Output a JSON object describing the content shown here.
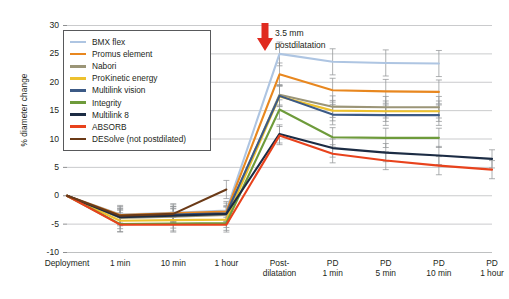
{
  "chart_data": {
    "type": "line",
    "title": "",
    "xlabel": "",
    "ylabel": "% diameter change",
    "ylim": [
      -10,
      30
    ],
    "ytick_values": [
      30,
      25,
      20,
      15,
      10,
      5,
      0,
      -5,
      -10
    ],
    "ytick_labels": [
      "30",
      "25",
      "20",
      "15",
      "10",
      "5",
      "0",
      "-5",
      "-10"
    ],
    "grid": "horizontal",
    "legend_position": "upper-left-inside",
    "categories": [
      "Deployment",
      "1 min",
      "10 min",
      "1 hour",
      "Post-dilatation",
      "PD 1 min",
      "PD 5 min",
      "PD 10 min",
      "PD 1 hour"
    ],
    "category_lines": [
      [
        "Deployment"
      ],
      [
        "1 min"
      ],
      [
        "10 min"
      ],
      [
        "1 hour"
      ],
      [
        "Post-",
        "dilatation"
      ],
      [
        "PD",
        "1 min"
      ],
      [
        "PD",
        "5 min"
      ],
      [
        "PD",
        "10 min"
      ],
      [
        "PD",
        "1 hour"
      ]
    ],
    "annotations": [
      {
        "name": "postdilatation-arrow",
        "text_lines": [
          "3.5 mm",
          "postdilatation"
        ],
        "arrow_color": "#e02b20",
        "at_category": "Post-dilatation"
      }
    ],
    "series": [
      {
        "name": "BMX flex",
        "color": "#aec5e2",
        "values": [
          0,
          -3.3,
          -3.0,
          -2.6,
          25.0,
          23.6,
          23.4,
          23.3,
          null
        ],
        "errors": [
          0,
          1.6,
          1.6,
          1.6,
          2.1,
          2.3,
          2.3,
          2.3,
          null
        ]
      },
      {
        "name": "Promus element",
        "color": "#e8871f",
        "values": [
          0,
          -3.4,
          -3.1,
          -2.8,
          21.4,
          18.6,
          18.4,
          18.3,
          null
        ],
        "errors": [
          0,
          1.5,
          1.5,
          1.5,
          2.0,
          2.1,
          2.1,
          2.1,
          null
        ]
      },
      {
        "name": "Nabori",
        "color": "#9b9577",
        "values": [
          0,
          -3.9,
          -3.7,
          -3.4,
          17.8,
          15.7,
          15.6,
          15.6,
          null
        ],
        "errors": [
          0,
          1.4,
          1.4,
          1.4,
          1.8,
          1.9,
          1.9,
          1.9,
          null
        ]
      },
      {
        "name": "ProKinetic energy",
        "color": "#edc12e",
        "values": [
          0,
          -4.4,
          -4.3,
          -4.2,
          17.5,
          15.0,
          14.9,
          14.9,
          null
        ],
        "errors": [
          0,
          1.4,
          1.4,
          1.4,
          1.8,
          1.8,
          1.8,
          1.8,
          null
        ]
      },
      {
        "name": "Multilink vision",
        "color": "#3c5a86",
        "values": [
          0,
          -3.6,
          -3.3,
          -3.1,
          17.6,
          14.3,
          14.2,
          14.2,
          null
        ],
        "errors": [
          0,
          1.4,
          1.4,
          1.4,
          1.8,
          1.8,
          1.8,
          1.8,
          null
        ]
      },
      {
        "name": "Integrity",
        "color": "#6e9b3b",
        "values": [
          0,
          -5.0,
          -4.9,
          -4.8,
          15.2,
          10.3,
          10.2,
          10.2,
          null
        ],
        "errors": [
          0,
          1.3,
          1.3,
          1.3,
          1.7,
          1.7,
          1.7,
          1.7,
          null
        ]
      },
      {
        "name": "Multilink 8",
        "color": "#1c2c44",
        "values": [
          0,
          -3.8,
          -3.5,
          -3.2,
          10.9,
          8.4,
          7.6,
          7.1,
          6.5
        ],
        "errors": [
          0,
          1.3,
          1.3,
          1.3,
          1.6,
          1.6,
          1.6,
          1.6,
          1.6
        ]
      },
      {
        "name": "ABSORB",
        "color": "#e8421c",
        "values": [
          0,
          -5.1,
          -5.1,
          -5.1,
          10.6,
          7.4,
          6.2,
          5.3,
          4.6
        ],
        "errors": [
          0,
          1.3,
          1.3,
          1.3,
          1.6,
          1.6,
          1.6,
          1.6,
          1.6
        ]
      },
      {
        "name": "DESolve (not postdilated)",
        "color": "#6b3a17",
        "values": [
          0,
          -3.5,
          -3.2,
          1.1,
          null,
          null,
          null,
          null,
          null
        ],
        "errors": [
          0,
          1.3,
          1.3,
          1.6,
          null,
          null,
          null,
          null,
          null
        ]
      }
    ]
  },
  "legend": {
    "items": [
      "BMX flex",
      "Promus element",
      "Nabori",
      "ProKinetic energy",
      "Multilink vision",
      "Integrity",
      "Multilink 8",
      "ABSORB",
      "DESolve (not postdilated)"
    ]
  }
}
